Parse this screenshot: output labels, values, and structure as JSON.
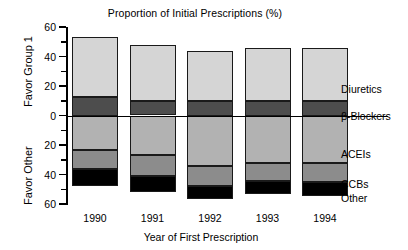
{
  "chart_data": {
    "type": "bar",
    "title": "Proportion of Initial Prescriptions (%)",
    "xlabel": "Year of First Prescription",
    "ylabel_top": "Favor Group 1",
    "ylabel_bottom": "Favor Other",
    "categories": [
      "1990",
      "1991",
      "1992",
      "1993",
      "1994"
    ],
    "ylim": [
      -60,
      60
    ],
    "yticks": [
      60,
      40,
      20,
      0,
      20,
      40,
      60
    ],
    "ytick_labels": [
      "60",
      "40",
      "20",
      "0",
      "20",
      "40",
      "60"
    ],
    "grid": false,
    "legend_position": "right",
    "orientation": "stacked-diverging",
    "note": "Positive (upward) segments favor Group 1; negative (downward) segments favor Other.",
    "series": [
      {
        "name": "Diuretics",
        "color": "#d5d5d5",
        "direction": "up",
        "values": [
          41.0,
          38.5,
          33.5,
          36.0,
          36.0
        ]
      },
      {
        "name": "β-Blockers",
        "color": "#4d4d4d",
        "direction": "up",
        "values": [
          12.5,
          9.5,
          10.0,
          10.0,
          10.0
        ]
      },
      {
        "name": "ACEIs",
        "color": "#b2b2b2",
        "direction": "down",
        "values": [
          23.5,
          27.0,
          34.0,
          32.5,
          32.5
        ]
      },
      {
        "name": "CCBs",
        "color": "#8c8c8c",
        "direction": "down",
        "values": [
          12.5,
          14.0,
          13.5,
          12.0,
          12.5
        ]
      },
      {
        "name": "Other",
        "color": "#000000",
        "direction": "down",
        "values": [
          12.0,
          11.0,
          9.0,
          9.0,
          9.5
        ]
      }
    ],
    "totals_up": [
      53.5,
      48.0,
      43.5,
      46.0,
      46.0
    ],
    "totals_down": [
      48.0,
      52.0,
      56.5,
      53.5,
      54.5
    ]
  },
  "legend": {
    "items": [
      {
        "label": "Diuretics"
      },
      {
        "label": "β-Blockers"
      },
      {
        "label": "ACEIs"
      },
      {
        "label": "CCBs"
      },
      {
        "label": "Other"
      }
    ]
  }
}
